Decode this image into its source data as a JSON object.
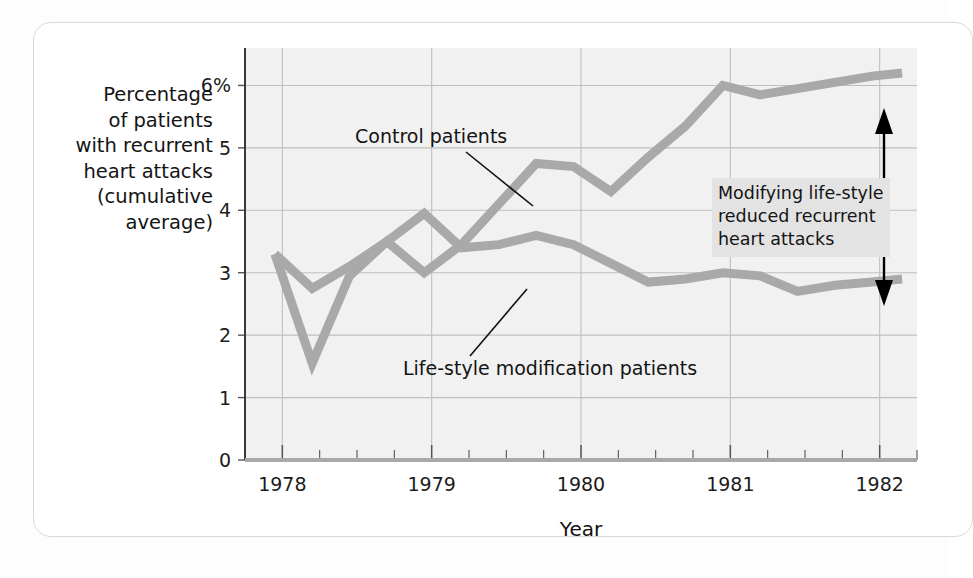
{
  "figure": {
    "y_axis_caption": "Percentage\nof patients\nwith recurrent\nheart attacks\n(cumulative\naverage)",
    "x_axis_title": "Year",
    "callout_text": "Modifying life-style\nreduced recurrent\nheart attacks",
    "series_label_control": "Control patients",
    "series_label_lifestyle": "Life-style modification patients"
  },
  "colors": {
    "line": "#a9a9a9",
    "plot_background": "#f1f1f1",
    "grid": "#bfbfbf",
    "axis": "#555555",
    "callout_background": "#e3e3e3",
    "arrow": "#000000",
    "card": "#ffffff"
  },
  "chart_data": {
    "type": "line",
    "title": "",
    "xlabel": "Year",
    "ylabel": "Percentage of patients with recurrent heart attacks (cumulative average)",
    "xlim": [
      1977.75,
      1982.25
    ],
    "ylim": [
      0,
      6.6
    ],
    "xticks": [
      1978,
      1979,
      1980,
      1981,
      1982
    ],
    "xtick_labels": [
      "1978",
      "1979",
      "1980",
      "1981",
      "1982"
    ],
    "xminor_step": 0.25,
    "yticks": [
      0,
      1,
      2,
      3,
      4,
      5,
      6
    ],
    "ytick_labels": [
      "0",
      "1",
      "2",
      "3",
      "4",
      "5",
      "6%"
    ],
    "grid": true,
    "legend": "inline-annotations",
    "series": [
      {
        "name": "Control patients",
        "x": [
          1977.95,
          1978.2,
          1978.45,
          1978.7,
          1978.95,
          1979.2,
          1979.45,
          1979.7,
          1979.95,
          1980.2,
          1980.45,
          1980.7,
          1980.95,
          1981.2,
          1981.45,
          1981.7,
          1981.95,
          1982.15
        ],
        "values": [
          3.3,
          1.55,
          2.95,
          3.5,
          3.0,
          3.45,
          4.1,
          4.75,
          4.7,
          4.3,
          4.85,
          5.35,
          6.0,
          5.85,
          5.95,
          6.05,
          6.15,
          6.2
        ]
      },
      {
        "name": "Life-style modification patients",
        "x": [
          1977.95,
          1978.2,
          1978.45,
          1978.7,
          1978.95,
          1979.2,
          1979.45,
          1979.7,
          1979.95,
          1980.2,
          1980.45,
          1980.7,
          1980.95,
          1981.2,
          1981.45,
          1981.7,
          1981.95,
          1982.15
        ],
        "values": [
          3.3,
          2.75,
          3.1,
          3.5,
          3.95,
          3.4,
          3.45,
          3.6,
          3.45,
          3.15,
          2.85,
          2.9,
          3.0,
          2.95,
          2.7,
          2.8,
          2.85,
          2.9
        ]
      }
    ],
    "annotations": [
      {
        "name": "gap-arrow",
        "text": "Modifying life-style reduced recurrent heart attacks",
        "x": 1982.1,
        "y_top": 6.15,
        "y_bottom": 2.9,
        "style": "double-headed-vertical-arrow"
      }
    ]
  }
}
